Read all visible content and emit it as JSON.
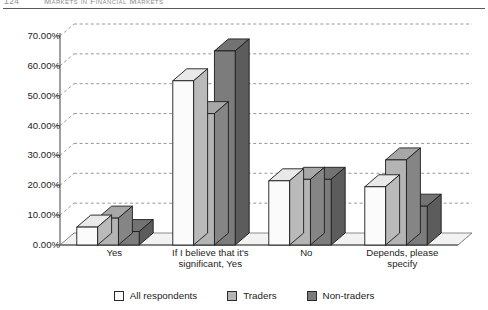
{
  "running_head": {
    "folio": "124",
    "title": "Markets in Financial Markets"
  },
  "colors": {
    "series_all_respondents": "#fbfbfb",
    "series_traders": "#b4b4b4",
    "series_non_traders": "#7c7c7c",
    "bar_outline": "#1c1c1c",
    "gridline": "#8c8c8c",
    "axis": "#6e6e6e",
    "floor": "#f2f2f2",
    "text": "#1d1d1d"
  },
  "legend": {
    "position": "bottom-center",
    "items": [
      {
        "label": "All respondents",
        "swatch_name": "legend-swatch-all-respondents",
        "color": "#fbfbfb"
      },
      {
        "label": "Traders",
        "swatch_name": "legend-swatch-traders",
        "color": "#b4b4b4"
      },
      {
        "label": "Non-traders",
        "swatch_name": "legend-swatch-non-traders",
        "color": "#7c7c7c"
      }
    ]
  },
  "axis": {
    "y_ticks": [
      "70.00%",
      "60.00%",
      "50.00%",
      "40.00%",
      "30.00%",
      "20.00%",
      "10.00%",
      "0.00%"
    ],
    "x_categories": [
      {
        "line1": "Yes",
        "line2": ""
      },
      {
        "line1": "If I believe that it's",
        "line2": "significant, Yes"
      },
      {
        "line1": "No",
        "line2": ""
      },
      {
        "line1": "Depends, please",
        "line2": "specify"
      }
    ]
  },
  "chart_data": {
    "type": "bar",
    "title": "",
    "subtitle": "",
    "xlabel": "",
    "ylabel": "",
    "ylim": [
      0,
      70
    ],
    "ytick_values": [
      0,
      10,
      20,
      30,
      40,
      50,
      60,
      70
    ],
    "ytick_format": "percent",
    "grid": true,
    "grid_style": "dashed-horizontal",
    "three_d": true,
    "legend_position": "bottom-center",
    "categories": [
      "Yes",
      "If I believe that it's significant, Yes",
      "No",
      "Depends, please specify"
    ],
    "series": [
      {
        "name": "All respondents",
        "color": "#fbfbfb",
        "values": [
          6.0,
          55.0,
          21.5,
          19.5
        ]
      },
      {
        "name": "Traders",
        "color": "#b4b4b4",
        "values": [
          9.0,
          44.0,
          22.0,
          28.5
        ]
      },
      {
        "name": "Non-traders",
        "color": "#7c7c7c",
        "values": [
          4.5,
          65.0,
          22.0,
          13.0
        ]
      }
    ]
  }
}
